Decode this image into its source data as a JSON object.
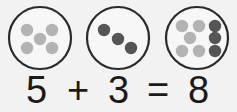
{
  "colors": {
    "background": "#f2f2f2",
    "circle_stroke": "#2a2a2a",
    "circle_fill": "#f7f7f7",
    "light_dot": "#b3b3b3",
    "dark_dot": "#555555",
    "text": "#1a1a1a"
  },
  "groups": [
    {
      "name": "group-five",
      "cx": 40,
      "cy": 38,
      "r": 31,
      "dots": [
        {
          "x": 27,
          "y": 30,
          "tone": "light"
        },
        {
          "x": 52,
          "y": 30,
          "tone": "light"
        },
        {
          "x": 40,
          "y": 39,
          "tone": "light"
        },
        {
          "x": 27,
          "y": 48,
          "tone": "light"
        },
        {
          "x": 52,
          "y": 48,
          "tone": "light"
        }
      ]
    },
    {
      "name": "group-three",
      "cx": 118,
      "cy": 38,
      "r": 31,
      "dots": [
        {
          "x": 104,
          "y": 30,
          "tone": "dark"
        },
        {
          "x": 118,
          "y": 39,
          "tone": "dark"
        },
        {
          "x": 131,
          "y": 48,
          "tone": "dark"
        }
      ]
    },
    {
      "name": "group-eight",
      "cx": 197,
      "cy": 38,
      "r": 31,
      "dots": [
        {
          "x": 182,
          "y": 26,
          "tone": "light"
        },
        {
          "x": 199,
          "y": 26,
          "tone": "light"
        },
        {
          "x": 190,
          "y": 38,
          "tone": "light"
        },
        {
          "x": 182,
          "y": 51,
          "tone": "light"
        },
        {
          "x": 199,
          "y": 51,
          "tone": "light"
        },
        {
          "x": 215,
          "y": 26,
          "tone": "dark"
        },
        {
          "x": 215,
          "y": 38,
          "tone": "dark"
        },
        {
          "x": 215,
          "y": 51,
          "tone": "dark"
        }
      ]
    }
  ],
  "equation": {
    "addend1": "5",
    "plus": "+",
    "addend2": "3",
    "equals": "=",
    "sum": "8"
  }
}
